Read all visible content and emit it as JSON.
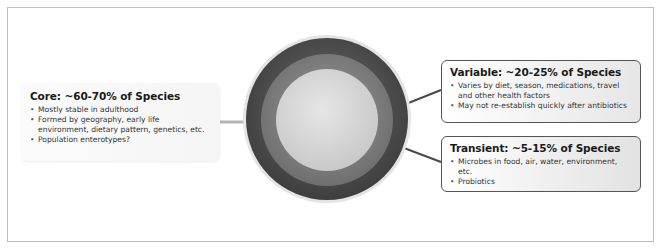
{
  "diagram": {
    "layers": [
      {
        "name": "core",
        "color": "#d9d9d9"
      },
      {
        "name": "variable",
        "color": "#8c8c8c"
      },
      {
        "name": "transient",
        "color": "#5c5c5c"
      }
    ],
    "core": {
      "title": "Core: ~60-70% of Species",
      "bullets": [
        "Mostly stable in adulthood",
        "Formed by geography, early life environment, dietary pattern, genetics, etc.",
        "Population enterotypes?"
      ]
    },
    "variable": {
      "title": "Variable: ~20-25% of Species",
      "bullets": [
        "Varies by diet, season, medications, travel and other health factors",
        "May not re-establish quickly after antibiotics"
      ]
    },
    "transient": {
      "title": "Transient: ~5-15% of Species",
      "bullets": [
        "Microbes in food, air, water, environment, etc.",
        "Probiotics"
      ]
    }
  }
}
